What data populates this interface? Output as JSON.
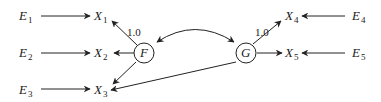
{
  "diagram": {
    "type": "path-diagram",
    "latent_factors": [
      {
        "id": "F",
        "label": "F",
        "cx": 144,
        "cy": 53
      },
      {
        "id": "G",
        "label": "G",
        "cx": 246,
        "cy": 53
      }
    ],
    "observed": [
      {
        "id": "X1",
        "base": "X",
        "sub": "1"
      },
      {
        "id": "X2",
        "base": "X",
        "sub": "2"
      },
      {
        "id": "X3",
        "base": "X",
        "sub": "3"
      },
      {
        "id": "X4",
        "base": "X",
        "sub": "4"
      },
      {
        "id": "X5",
        "base": "X",
        "sub": "5"
      }
    ],
    "errors": [
      {
        "id": "E1",
        "base": "E",
        "sub": "1"
      },
      {
        "id": "E2",
        "base": "E",
        "sub": "2"
      },
      {
        "id": "E3",
        "base": "E",
        "sub": "3"
      },
      {
        "id": "E4",
        "base": "E",
        "sub": "4"
      },
      {
        "id": "E5",
        "base": "E",
        "sub": "5"
      }
    ],
    "edges": [
      {
        "from": "E1",
        "to": "X1"
      },
      {
        "from": "E2",
        "to": "X2"
      },
      {
        "from": "E3",
        "to": "X3"
      },
      {
        "from": "E4",
        "to": "X4"
      },
      {
        "from": "E5",
        "to": "X5"
      },
      {
        "from": "F",
        "to": "X1",
        "label": "1.0"
      },
      {
        "from": "F",
        "to": "X2"
      },
      {
        "from": "F",
        "to": "X3"
      },
      {
        "from": "G",
        "to": "X4",
        "label": "1.0"
      },
      {
        "from": "G",
        "to": "X5"
      },
      {
        "from": "G",
        "to": "X3"
      },
      {
        "from": "F",
        "to": "G",
        "bidirectional": true,
        "curved": true
      }
    ],
    "loadings": {
      "F_X1": "1.0",
      "G_X4": "1.0"
    }
  }
}
